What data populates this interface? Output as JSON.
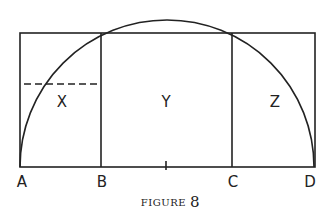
{
  "figure": {
    "caption_word": "FIGURE",
    "caption_number": "8",
    "points": [
      "A",
      "B",
      "C",
      "D"
    ],
    "regions": [
      "X",
      "Y",
      "Z"
    ]
  },
  "colors": {
    "stroke": "#222222",
    "background": "#ffffff"
  }
}
